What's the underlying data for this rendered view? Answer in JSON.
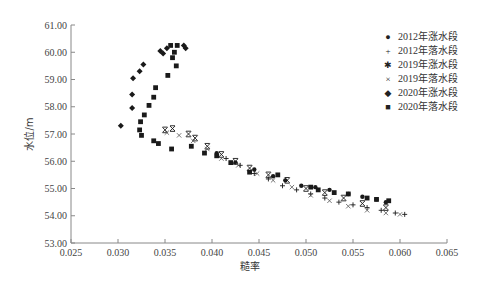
{
  "chart_data": {
    "type": "scatter",
    "title": "",
    "xlabel": "糙率",
    "ylabel": "水位/m",
    "xlim": [
      0.025,
      0.065
    ],
    "ylim": [
      53.0,
      61.0
    ],
    "x_ticks": [
      "0.025",
      "0.030",
      "0.035",
      "0.040",
      "0.045",
      "0.050",
      "0.055",
      "0.060",
      "0.065"
    ],
    "y_ticks": [
      "53.00",
      "54.00",
      "55.00",
      "56.00",
      "57.00",
      "58.00",
      "59.00",
      "60.00",
      "61.00"
    ],
    "grid": false,
    "legend_position": "right-top",
    "series": [
      {
        "name": "2012年涨水段",
        "marker": "circle",
        "points": [
          [
            0.0405,
            56.3
          ],
          [
            0.0425,
            55.95
          ],
          [
            0.0445,
            55.7
          ],
          [
            0.0465,
            55.45
          ],
          [
            0.0478,
            55.3
          ],
          [
            0.0495,
            55.1
          ],
          [
            0.051,
            55.05
          ],
          [
            0.0525,
            54.95
          ],
          [
            0.0545,
            54.8
          ],
          [
            0.056,
            54.7
          ],
          [
            0.0575,
            54.6
          ],
          [
            0.0585,
            54.5
          ]
        ]
      },
      {
        "name": "2012年落水段",
        "marker": "plus",
        "points": [
          [
            0.0415,
            56.1
          ],
          [
            0.043,
            55.85
          ],
          [
            0.0445,
            55.55
          ],
          [
            0.046,
            55.35
          ],
          [
            0.0475,
            55.1
          ],
          [
            0.049,
            54.95
          ],
          [
            0.0505,
            54.8
          ],
          [
            0.052,
            54.65
          ],
          [
            0.0535,
            54.5
          ],
          [
            0.055,
            54.4
          ],
          [
            0.0565,
            54.3
          ],
          [
            0.058,
            54.2
          ],
          [
            0.0595,
            54.1
          ],
          [
            0.0605,
            54.05
          ]
        ]
      },
      {
        "name": "2019年涨水段",
        "marker": "asterisk",
        "points": [
          [
            0.035,
            57.15
          ],
          [
            0.0358,
            57.2
          ],
          [
            0.0375,
            57.0
          ],
          [
            0.0382,
            56.85
          ],
          [
            0.0395,
            56.55
          ],
          [
            0.041,
            56.25
          ],
          [
            0.0425,
            56.0
          ],
          [
            0.044,
            55.75
          ],
          [
            0.046,
            55.5
          ],
          [
            0.048,
            55.3
          ],
          [
            0.05,
            55.0
          ],
          [
            0.052,
            54.85
          ],
          [
            0.054,
            54.65
          ],
          [
            0.056,
            54.45
          ],
          [
            0.0585,
            54.3
          ]
        ]
      },
      {
        "name": "2019年落水段",
        "marker": "x",
        "points": [
          [
            0.0352,
            57.05
          ],
          [
            0.0365,
            56.95
          ],
          [
            0.038,
            56.75
          ],
          [
            0.0395,
            56.45
          ],
          [
            0.041,
            56.1
          ],
          [
            0.0428,
            55.85
          ],
          [
            0.0448,
            55.55
          ],
          [
            0.0465,
            55.3
          ],
          [
            0.0485,
            55.05
          ],
          [
            0.0505,
            54.75
          ],
          [
            0.0525,
            54.55
          ],
          [
            0.0545,
            54.35
          ],
          [
            0.0565,
            54.2
          ],
          [
            0.0585,
            54.1
          ],
          [
            0.06,
            54.05
          ]
        ]
      },
      {
        "name": "2020年涨水段",
        "marker": "diamond",
        "points": [
          [
            0.0303,
            57.3
          ],
          [
            0.0315,
            57.95
          ],
          [
            0.0315,
            58.45
          ],
          [
            0.0316,
            59.05
          ],
          [
            0.0323,
            59.3
          ],
          [
            0.0327,
            59.55
          ],
          [
            0.0345,
            60.05
          ],
          [
            0.0348,
            59.95
          ],
          [
            0.0352,
            60.15
          ],
          [
            0.037,
            60.25
          ],
          [
            0.0372,
            60.15
          ]
        ]
      },
      {
        "name": "2020年落水段",
        "marker": "square",
        "points": [
          [
            0.0356,
            60.25
          ],
          [
            0.0363,
            60.25
          ],
          [
            0.036,
            60.0
          ],
          [
            0.0358,
            59.8
          ],
          [
            0.0362,
            59.5
          ],
          [
            0.0353,
            59.15
          ],
          [
            0.034,
            58.7
          ],
          [
            0.0338,
            58.35
          ],
          [
            0.0333,
            58.05
          ],
          [
            0.0328,
            57.7
          ],
          [
            0.0324,
            57.45
          ],
          [
            0.0323,
            57.15
          ],
          [
            0.0325,
            56.95
          ],
          [
            0.0338,
            56.75
          ],
          [
            0.0343,
            56.65
          ],
          [
            0.0357,
            56.45
          ],
          [
            0.0378,
            56.55
          ],
          [
            0.0392,
            56.3
          ],
          [
            0.0405,
            56.2
          ],
          [
            0.042,
            55.95
          ],
          [
            0.044,
            55.6
          ],
          [
            0.047,
            55.5
          ],
          [
            0.0505,
            55.05
          ],
          [
            0.0513,
            54.95
          ],
          [
            0.053,
            54.85
          ],
          [
            0.0545,
            54.8
          ],
          [
            0.0565,
            54.65
          ],
          [
            0.0575,
            54.6
          ],
          [
            0.0588,
            54.55
          ]
        ]
      }
    ]
  },
  "axes": {
    "x_title": "糙率",
    "y_title": "水位/m"
  },
  "legend": {
    "items": [
      {
        "label": "2012年涨水段",
        "glyph": "●"
      },
      {
        "label": "2012年落水段",
        "glyph": "+"
      },
      {
        "label": "2019年涨水段",
        "glyph": "✱"
      },
      {
        "label": "2019年落水段",
        "glyph": "×"
      },
      {
        "label": "2020年涨水段",
        "glyph": "◆"
      },
      {
        "label": "2020年落水段",
        "glyph": "■"
      }
    ]
  },
  "colors": {
    "axis": "#888888",
    "marker": "#1a1a1a"
  }
}
